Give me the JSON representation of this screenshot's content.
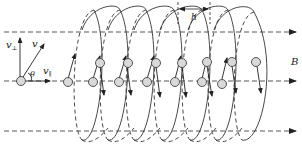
{
  "diagram": {
    "labels": {
      "v_perp": "v",
      "v_perp_sub": "⊥",
      "v": "v",
      "v_par": "v",
      "v_par_sub": "∥",
      "theta": "θ",
      "pitch": "h",
      "field": "B"
    },
    "field_lines": 3,
    "loops": 7,
    "colors": {
      "line": "#333333",
      "particle_fill": "#d9d9d9",
      "background": "#ffffff"
    }
  }
}
